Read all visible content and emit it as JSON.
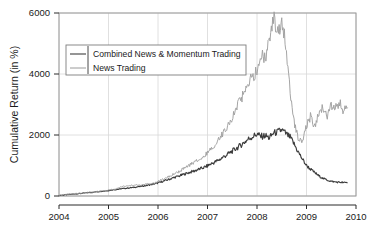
{
  "chart_data": {
    "type": "line",
    "title": "",
    "xlabel": "",
    "ylabel": "Cumulative Return (in %)",
    "xlim": [
      2004,
      2010
    ],
    "ylim": [
      0,
      6000
    ],
    "xticks": [
      "2004",
      "2005",
      "2006",
      "2007",
      "2008",
      "2009",
      "2010"
    ],
    "yticks": [
      "0",
      "2000",
      "4000",
      "6000"
    ],
    "grid": true,
    "legend_position": "upper-left-inside",
    "legend": [
      {
        "label": "Combined News & Momentum Trading",
        "color": "#4d4d4d"
      },
      {
        "label": "News Trading",
        "color": "#9a9a9a"
      }
    ],
    "series": [
      {
        "name": "Combined News & Momentum Trading",
        "color": "#3c3c3c",
        "x": [
          2004.0,
          2004.08,
          2004.17,
          2004.25,
          2004.33,
          2004.42,
          2004.5,
          2004.58,
          2004.67,
          2004.75,
          2004.83,
          2004.92,
          2005.0,
          2005.08,
          2005.17,
          2005.25,
          2005.33,
          2005.42,
          2005.5,
          2005.58,
          2005.67,
          2005.75,
          2005.83,
          2005.92,
          2006.0,
          2006.08,
          2006.17,
          2006.25,
          2006.33,
          2006.42,
          2006.5,
          2006.58,
          2006.67,
          2006.75,
          2006.83,
          2006.92,
          2007.0,
          2007.08,
          2007.17,
          2007.25,
          2007.33,
          2007.42,
          2007.5,
          2007.58,
          2007.67,
          2007.75,
          2007.83,
          2007.92,
          2008.0,
          2008.08,
          2008.17,
          2008.25,
          2008.33,
          2008.42,
          2008.5,
          2008.58,
          2008.67,
          2008.75,
          2008.83,
          2008.92,
          2009.0,
          2009.08,
          2009.17,
          2009.25,
          2009.33,
          2009.42,
          2009.5,
          2009.58,
          2009.67,
          2009.75,
          2009.83
        ],
        "y": [
          20,
          30,
          45,
          55,
          70,
          80,
          95,
          110,
          120,
          135,
          150,
          165,
          180,
          200,
          215,
          235,
          250,
          265,
          280,
          300,
          320,
          340,
          365,
          395,
          430,
          470,
          520,
          560,
          610,
          650,
          700,
          745,
          790,
          830,
          880,
          930,
          990,
          1060,
          1130,
          1200,
          1290,
          1380,
          1470,
          1560,
          1660,
          1770,
          1870,
          1960,
          2030,
          1950,
          1980,
          1900,
          2060,
          2100,
          2170,
          2050,
          1920,
          1700,
          1450,
          1200,
          1000,
          880,
          760,
          660,
          580,
          520,
          480,
          460,
          450,
          440,
          440
        ]
      },
      {
        "name": "News Trading",
        "color": "#a0a0a0",
        "x": [
          2004.0,
          2004.08,
          2004.17,
          2004.25,
          2004.33,
          2004.42,
          2004.5,
          2004.58,
          2004.67,
          2004.75,
          2004.83,
          2004.92,
          2005.0,
          2005.08,
          2005.17,
          2005.25,
          2005.33,
          2005.42,
          2005.5,
          2005.58,
          2005.67,
          2005.75,
          2005.83,
          2005.92,
          2006.0,
          2006.08,
          2006.17,
          2006.25,
          2006.33,
          2006.42,
          2006.5,
          2006.58,
          2006.67,
          2006.75,
          2006.83,
          2006.92,
          2007.0,
          2007.08,
          2007.17,
          2007.25,
          2007.33,
          2007.42,
          2007.5,
          2007.58,
          2007.67,
          2007.75,
          2007.83,
          2007.92,
          2008.0,
          2008.08,
          2008.17,
          2008.25,
          2008.33,
          2008.42,
          2008.5,
          2008.58,
          2008.67,
          2008.75,
          2008.83,
          2008.92,
          2009.0,
          2009.08,
          2009.17,
          2009.25,
          2009.33,
          2009.42,
          2009.5,
          2009.58,
          2009.67,
          2009.75,
          2009.83
        ],
        "y": [
          20,
          35,
          50,
          60,
          75,
          85,
          100,
          115,
          125,
          140,
          155,
          175,
          195,
          215,
          240,
          300,
          330,
          345,
          355,
          360,
          370,
          380,
          400,
          430,
          480,
          540,
          600,
          660,
          730,
          800,
          880,
          960,
          1040,
          1120,
          1210,
          1300,
          1420,
          1560,
          1720,
          1900,
          2100,
          2320,
          2580,
          2860,
          3150,
          3450,
          3700,
          3900,
          4100,
          4600,
          4450,
          5100,
          5850,
          5300,
          5700,
          5000,
          3400,
          2400,
          1900,
          1750,
          2300,
          2600,
          2250,
          2700,
          2900,
          2600,
          2950,
          2850,
          3050,
          2800,
          2900
        ]
      }
    ]
  },
  "geometry": {
    "plot_left": 59,
    "plot_right": 356,
    "plot_top": 13,
    "plot_bottom": 196,
    "frame_bottom": 205
  },
  "style": {
    "background": "#ffffff",
    "frame_color": "#9a9a9a",
    "grid_color": "#d8d8d8",
    "text_color": "#1a1a1a"
  }
}
